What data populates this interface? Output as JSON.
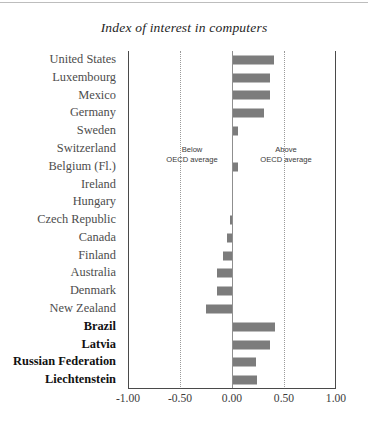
{
  "chart_data": {
    "type": "bar",
    "orientation": "horizontal",
    "title": "Index of interest in computers",
    "xlabel": "",
    "ylabel": "",
    "xlim": [
      -1.0,
      1.0
    ],
    "xticks": [
      "-1.00",
      "-0.50",
      "0.00",
      "0.50",
      "1.00"
    ],
    "xtick_values": [
      -1.0,
      -0.5,
      0.0,
      0.5,
      1.0
    ],
    "grid": "vertical dotted at -0.50 and 0.50; solid axis at -1.00 and 1.00; zero reference line at 0.00",
    "legend": "none",
    "bar_color": "#7c7c7c",
    "annotations": [
      {
        "text_line1": "Below",
        "text_line2": "OECD average",
        "side": "left"
      },
      {
        "text_line1": "Above",
        "text_line2": "OECD average",
        "side": "right"
      }
    ],
    "categories": [
      "United States",
      "Luxembourg",
      "Mexico",
      "Germany",
      "Sweden",
      "Switzerland",
      "Belgium (Fl.)",
      "Ireland",
      "Hungary",
      "Czech Republic",
      "Canada",
      "Finland",
      "Australia",
      "Denmark",
      "New Zealand",
      "Brazil",
      "Latvia",
      "Russian Federation",
      "Liechtenstein"
    ],
    "values": [
      0.4,
      0.37,
      0.37,
      0.31,
      0.06,
      0.0,
      0.06,
      0.0,
      0.0,
      -0.02,
      -0.05,
      -0.09,
      -0.14,
      -0.14,
      -0.25,
      0.41,
      0.37,
      0.23,
      0.24
    ],
    "emphasized_categories": [
      "Brazil",
      "Latvia",
      "Russian Federation",
      "Liechtenstein"
    ]
  }
}
